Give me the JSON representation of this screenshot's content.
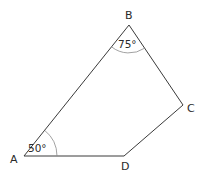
{
  "figure": {
    "type": "quadrilateral",
    "vertices": [
      {
        "id": "A",
        "label": "A",
        "x": 24,
        "y": 156
      },
      {
        "id": "B",
        "label": "B",
        "x": 129,
        "y": 25
      },
      {
        "id": "C",
        "label": "C",
        "x": 183,
        "y": 105
      },
      {
        "id": "D",
        "label": "D",
        "x": 124,
        "y": 156
      }
    ],
    "edges": [
      [
        "A",
        "B"
      ],
      [
        "B",
        "C"
      ],
      [
        "C",
        "D"
      ],
      [
        "D",
        "A"
      ]
    ],
    "angles": [
      {
        "vertex": "A",
        "label": "50°",
        "value": 50
      },
      {
        "vertex": "B",
        "label": "75°",
        "value": 75
      }
    ]
  },
  "labels": {
    "A": "A",
    "B": "B",
    "C": "C",
    "D": "D",
    "angle_A": "50°",
    "angle_B": "75°"
  },
  "colors": {
    "stroke": "#3a3a3a",
    "arc": "#8a8a8a",
    "text": "#2a2a2a",
    "background": "#ffffff"
  }
}
